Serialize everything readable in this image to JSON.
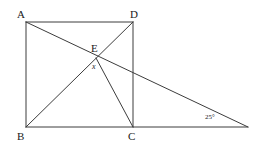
{
  "figure": {
    "type": "geometry-diagram",
    "stroke_color": "#3c3c3c",
    "background_color": "#ffffff",
    "text_color": "#1a1a1a",
    "width": 259,
    "height": 154,
    "points": [
      {
        "id": "A",
        "label": "A",
        "x": 26,
        "y": 22,
        "label_x": 17,
        "label_y": 9
      },
      {
        "id": "D",
        "label": "D",
        "x": 133,
        "y": 22,
        "label_x": 130,
        "label_y": 9
      },
      {
        "id": "E",
        "label": "E",
        "x": 96,
        "y": 58,
        "label_x": 91,
        "label_y": 43
      },
      {
        "id": "B",
        "label": "B",
        "x": 26,
        "y": 127,
        "label_x": 17,
        "label_y": 131
      },
      {
        "id": "C",
        "label": "C",
        "x": 133,
        "y": 127,
        "label_x": 128,
        "label_y": 131
      },
      {
        "id": "F",
        "label": "",
        "x": 248,
        "y": 127,
        "label_x": 0,
        "label_y": 0
      }
    ],
    "segments": [
      {
        "name": "side-AB",
        "from": "A",
        "to": "B"
      },
      {
        "name": "side-AD",
        "from": "A",
        "to": "D"
      },
      {
        "name": "side-DC",
        "from": "D",
        "to": "C"
      },
      {
        "name": "base-BF",
        "from": "B",
        "to": "F"
      },
      {
        "name": "diagonal-DB",
        "from": "D",
        "to": "B"
      },
      {
        "name": "line-AF",
        "from": "A",
        "to": "F"
      },
      {
        "name": "segment-EC",
        "from": "E",
        "to": "C"
      }
    ],
    "angle_labels": [
      {
        "name": "angle-x-at-E",
        "text": "x",
        "x": 92,
        "y": 63,
        "style": "variable"
      },
      {
        "name": "angle-25-at-F",
        "text": "25°",
        "x": 205,
        "y": 114,
        "style": "measure"
      }
    ]
  }
}
